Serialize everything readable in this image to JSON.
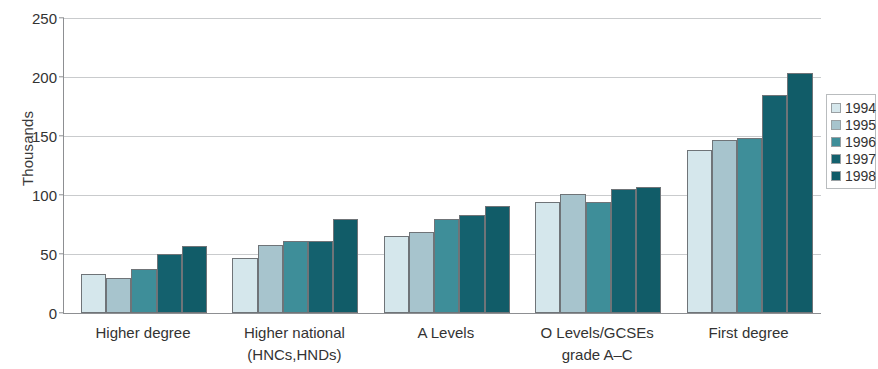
{
  "chart_data": {
    "type": "bar",
    "title": "",
    "xlabel": "",
    "ylabel": "Thousands",
    "ylim": [
      0,
      250
    ],
    "yticks": [
      0,
      50,
      100,
      150,
      200,
      250
    ],
    "ytick_labels": [
      "0",
      "50",
      "100",
      "150",
      "200",
      "250"
    ],
    "grid": "horizontal",
    "legend_position": "right",
    "categories": [
      "Higher degree",
      "Higher national (HNCs,HNDs)",
      "A Levels",
      "O Levels/GCSEs grade A–C",
      "First degree"
    ],
    "category_lines": [
      [
        "Higher degree",
        ""
      ],
      [
        "Higher national",
        "(HNCs,HNDs)"
      ],
      [
        "A Levels",
        ""
      ],
      [
        "O Levels/GCSEs",
        "grade A–C"
      ],
      [
        "First degree",
        ""
      ]
    ],
    "series": [
      {
        "name": "1994",
        "color": "#d5e7ec",
        "values": [
          33,
          47,
          65,
          94,
          138
        ]
      },
      {
        "name": "1995",
        "color": "#a7c4cd",
        "values": [
          30,
          58,
          69,
          101,
          147
        ]
      },
      {
        "name": "1996",
        "color": "#3e8e99",
        "values": [
          37,
          61,
          80,
          94,
          148
        ]
      },
      {
        "name": "1997",
        "color": "#14616e",
        "values": [
          50,
          61,
          83,
          105,
          185
        ]
      },
      {
        "name": "1998",
        "color": "#115c68",
        "values": [
          57,
          80,
          91,
          107,
          203
        ]
      }
    ]
  }
}
